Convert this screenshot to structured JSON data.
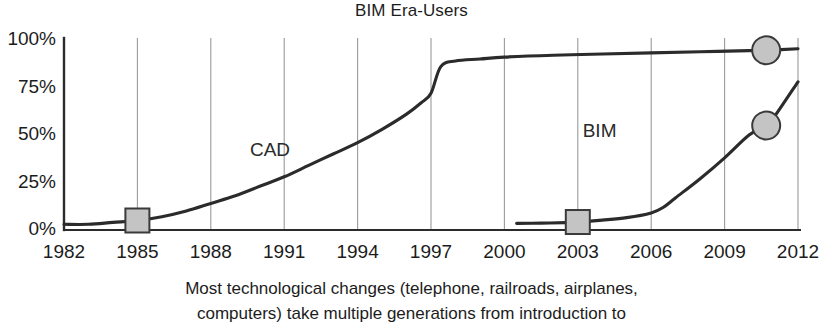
{
  "chart_data": {
    "type": "line",
    "title": "BIM Era-Users",
    "xlabel": "",
    "ylabel": "",
    "xlim": [
      1982,
      2012
    ],
    "ylim": [
      0,
      100
    ],
    "grid": true,
    "legend_position": "inline-annotations",
    "xticks": [
      "1982",
      "1985",
      "1988",
      "1991",
      "1994",
      "1997",
      "2000",
      "2003",
      "2006",
      "2009",
      "2012"
    ],
    "yticks": [
      "0%",
      "25%",
      "50%",
      "75%",
      "100%"
    ],
    "ytick_values": [
      0,
      25,
      50,
      75,
      100
    ],
    "xtick_values": [
      1982,
      1985,
      1988,
      1991,
      1994,
      1997,
      2000,
      2003,
      2006,
      2009,
      2012
    ],
    "series": [
      {
        "name": "CAD",
        "label": "CAD",
        "color": "#2b2b2b",
        "x": [
          1982,
          1983,
          1984,
          1985,
          1986,
          1987,
          1988,
          1989,
          1990,
          1991,
          1992,
          1993,
          1994,
          1995,
          1996,
          1996.6,
          1997,
          1997.4,
          1998,
          1999,
          2000,
          2002,
          2004,
          2006,
          2008,
          2010,
          2010.7,
          2012
        ],
        "values": [
          3,
          3,
          4,
          5,
          7,
          10,
          14,
          18,
          23,
          28,
          34,
          40,
          46,
          53,
          61,
          67,
          72,
          86,
          89,
          90,
          91,
          92,
          92.6,
          93.2,
          93.8,
          94.4,
          94.6,
          95.4
        ]
      },
      {
        "name": "BIM",
        "label": "BIM",
        "color": "#2b2b2b",
        "x": [
          2000.5,
          2001.5,
          2002.5,
          2003,
          2004,
          2005,
          2006,
          2006.5,
          2007,
          2008,
          2009,
          2010,
          2010.7,
          2011,
          2012
        ],
        "values": [
          3.5,
          3.6,
          3.9,
          4.2,
          5.2,
          6.5,
          9,
          12,
          17,
          27,
          38,
          50,
          55,
          59,
          78
        ]
      }
    ],
    "markers": [
      {
        "name": "cad-start-marker",
        "shape": "square",
        "x": 1985,
        "y": 5,
        "fill": "#c4c4c4",
        "stroke": "#3a3a3a"
      },
      {
        "name": "bim-start-marker",
        "shape": "square",
        "x": 2003,
        "y": 4.2,
        "fill": "#c4c4c4",
        "stroke": "#3a3a3a"
      },
      {
        "name": "cad-end-marker",
        "shape": "circle",
        "x": 2010.7,
        "y": 94.6,
        "fill": "#c4c4c4",
        "stroke": "#3a3a3a"
      },
      {
        "name": "bim-end-marker",
        "shape": "circle",
        "x": 2010.7,
        "y": 55,
        "fill": "#c4c4c4",
        "stroke": "#3a3a3a"
      }
    ],
    "annotations": [
      {
        "text": "CAD",
        "x": 1989.6,
        "y": 42
      },
      {
        "text": "BIM",
        "x": 2003.2,
        "y": 52
      }
    ]
  },
  "caption": {
    "line1": "Most technological changes (telephone, railroads, airplanes,",
    "line2": "computers) take multiple generations from introduction to"
  },
  "colors": {
    "curve": "#2b2b2b",
    "gridline": "#9a9a9a",
    "axis": "#2b2b2b",
    "marker_fill": "#c4c4c4",
    "marker_stroke": "#3a3a3a",
    "text": "#1c1c1c",
    "background": "#ffffff"
  }
}
